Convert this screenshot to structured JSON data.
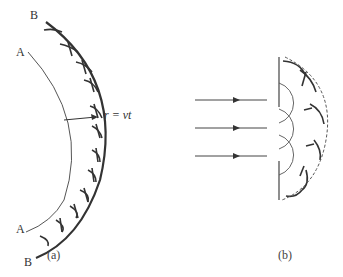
{
  "figure_a": {
    "label_a_top": "A",
    "label_a_bottom": "A",
    "label_b_top": "B",
    "label_b_bottom": "B",
    "radius_label": "r = vt",
    "panel_label": "(a)"
  },
  "figure_b": {
    "panel_label": "(b)",
    "incident_rays": 3
  },
  "caption": "图 Huygens principle (cut off)",
  "colors": {
    "stroke": "#333333",
    "thin_stroke": "#555555"
  }
}
